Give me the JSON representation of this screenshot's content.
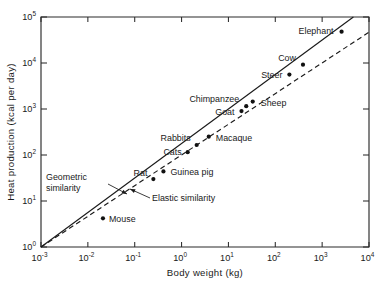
{
  "chart_data": {
    "type": "scatter",
    "title": "",
    "xlabel": "Body weight (kg)",
    "ylabel": "Heat production (kcal per day)",
    "xscale": "log",
    "yscale": "log",
    "xlim": [
      0.001,
      10000
    ],
    "ylim": [
      1,
      100000
    ],
    "grid": false,
    "legend_position": "none",
    "x_tick_labels": [
      "10⁻³",
      "10⁻²",
      "10⁻¹",
      "10⁰",
      "10¹",
      "10²",
      "10³",
      "10⁴"
    ],
    "x_tick_mantissas": [
      "10",
      "10",
      "10",
      "10",
      "10",
      "10",
      "10",
      "10"
    ],
    "x_tick_exponents": [
      "-3",
      "-2",
      "-1",
      "0",
      "1",
      "2",
      "3",
      "4"
    ],
    "x_tick_values": [
      0.001,
      0.01,
      0.1,
      1,
      10,
      100,
      1000,
      10000
    ],
    "y_tick_labels": [
      "10⁰",
      "10¹",
      "10²",
      "10³",
      "10⁴",
      "10⁵"
    ],
    "y_tick_mantissas": [
      "10",
      "10",
      "10",
      "10",
      "10",
      "10"
    ],
    "y_tick_exponents": [
      "0",
      "1",
      "2",
      "3",
      "4",
      "5"
    ],
    "y_tick_values": [
      1,
      10,
      100,
      1000,
      10000,
      100000
    ],
    "points": [
      {
        "label": "Mouse",
        "x": 0.021,
        "y": 4.2,
        "label_dx": 6,
        "label_dy": 3.5,
        "anchor": "start"
      },
      {
        "label": "Rat",
        "x": 0.25,
        "y": 30,
        "label_dx": -6,
        "label_dy": -3,
        "anchor": "end"
      },
      {
        "label": "Guinea pig",
        "x": 0.41,
        "y": 44,
        "label_dx": 7,
        "label_dy": 3.5,
        "anchor": "start"
      },
      {
        "label": "Cats",
        "x": 1.35,
        "y": 115,
        "label_dx": -6,
        "label_dy": 3,
        "anchor": "end"
      },
      {
        "label": "Rabbits",
        "x": 2.1,
        "y": 165,
        "label_dx": -6,
        "label_dy": -3.5,
        "anchor": "end"
      },
      {
        "label": "Macaque",
        "x": 3.8,
        "y": 250,
        "label_dx": 7,
        "label_dy": 4,
        "anchor": "start"
      },
      {
        "label": "Goat",
        "x": 19,
        "y": 900,
        "label_dx": -7,
        "label_dy": 3.5,
        "anchor": "end"
      },
      {
        "label": "Chimpanzee",
        "x": 24,
        "y": 1150,
        "label_dx": -7,
        "label_dy": -4,
        "anchor": "end"
      },
      {
        "label": "Sheep",
        "x": 33,
        "y": 1450,
        "label_dx": 8,
        "label_dy": 4,
        "anchor": "start"
      },
      {
        "label": "Steer",
        "x": 200,
        "y": 5600,
        "label_dx": -7,
        "label_dy": 3.5,
        "anchor": "end"
      },
      {
        "label": "Cow",
        "x": 390,
        "y": 9200,
        "label_dx": -7,
        "label_dy": -4,
        "anchor": "end"
      },
      {
        "label": "Elephant",
        "x": 2600,
        "y": 48000,
        "label_dx": -8,
        "label_dy": 2.5,
        "anchor": "end"
      }
    ],
    "series": [
      {
        "name": "Elastic similarity",
        "style": "solid",
        "slope": 0.75,
        "intercept_at_x0": 1.0,
        "x_start": 0.001,
        "x_end": 10000
      },
      {
        "name": "Geometric similarity",
        "style": "dashed",
        "slope": 0.667,
        "intercept_at_x0": 1.0,
        "x_start": 0.001,
        "x_end": 10000
      }
    ],
    "annotations": [
      {
        "name": "geometric-similarity",
        "line1": "Geometric",
        "line2": "similarity",
        "text_x": 46,
        "text_y": 180,
        "arrow_from_x": 108,
        "arrow_from_y": 184,
        "arrow_to_x": 127,
        "arrow_to_y": 194
      },
      {
        "name": "elastic-similarity",
        "line1": "Elastic similarity",
        "line2": "",
        "text_x": 152,
        "text_y": 201,
        "arrow_from_x": 150,
        "arrow_from_y": 198,
        "arrow_to_x": 130,
        "arrow_to_y": 189
      }
    ]
  }
}
